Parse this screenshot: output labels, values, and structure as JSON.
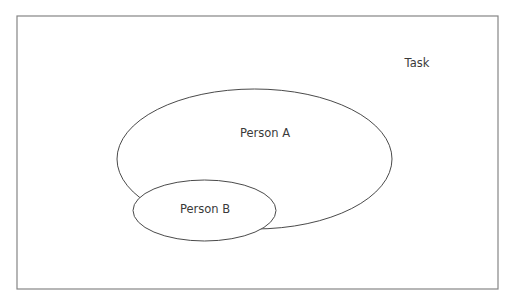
{
  "diagram": {
    "type": "nested-sets",
    "frame": {
      "label": "Task",
      "x": 17,
      "y": 16,
      "width": 481,
      "height": 273,
      "stroke_color": "#858585"
    },
    "sets": [
      {
        "id": "person-a",
        "label": "Person A",
        "cx": 254.5,
        "cy": 159,
        "rx": 137.5,
        "ry": 70,
        "label_x": 265,
        "label_y": 133
      },
      {
        "id": "person-b",
        "label": "Person B",
        "cx": 204.5,
        "cy": 210.5,
        "rx": 71.5,
        "ry": 30.5,
        "label_x": 205,
        "label_y": 209
      }
    ],
    "task_label_pos": {
      "x": 417,
      "y": 63
    },
    "colors": {
      "line": "#4a4a4a",
      "text": "#3a3a3a",
      "background": "#ffffff"
    }
  }
}
